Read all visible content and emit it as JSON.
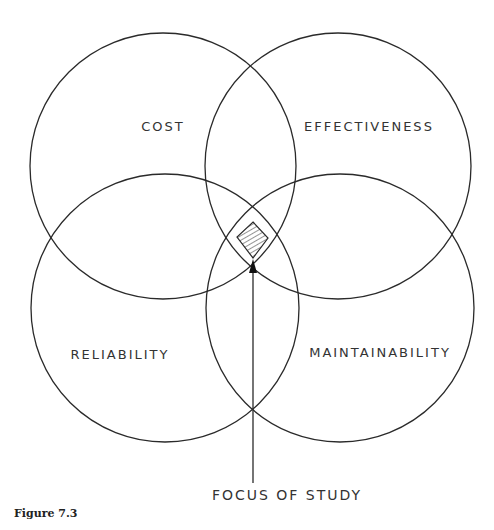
{
  "figure": {
    "caption": "Figure 7.3",
    "circles": [
      {
        "id": "cost",
        "label": "COST",
        "cx": 163,
        "cy": 166,
        "r": 133,
        "label_x": 163,
        "label_y": 131
      },
      {
        "id": "effectiveness",
        "label": "EFFECTIVENESS",
        "cx": 338,
        "cy": 166,
        "r": 133,
        "label_x": 369,
        "label_y": 131
      },
      {
        "id": "reliability",
        "label": "RELIABILITY",
        "cx": 165,
        "cy": 308,
        "r": 134,
        "label_x": 120,
        "label_y": 359
      },
      {
        "id": "maintainability",
        "label": "MAINTAINABILITY",
        "cx": 340,
        "cy": 308,
        "r": 134,
        "label_x": 380,
        "label_y": 357
      }
    ],
    "focus": {
      "label": "FOCUS OF STUDY",
      "label_x": 287,
      "label_y": 500,
      "region_points": "253,222 268,238 253,258 237,237",
      "arrow_x": 253,
      "arrow_tip_y": 259,
      "arrow_end_y": 483
    },
    "colors": {
      "stroke": "#2a2a2a",
      "text": "#333333",
      "background": "#ffffff"
    }
  }
}
